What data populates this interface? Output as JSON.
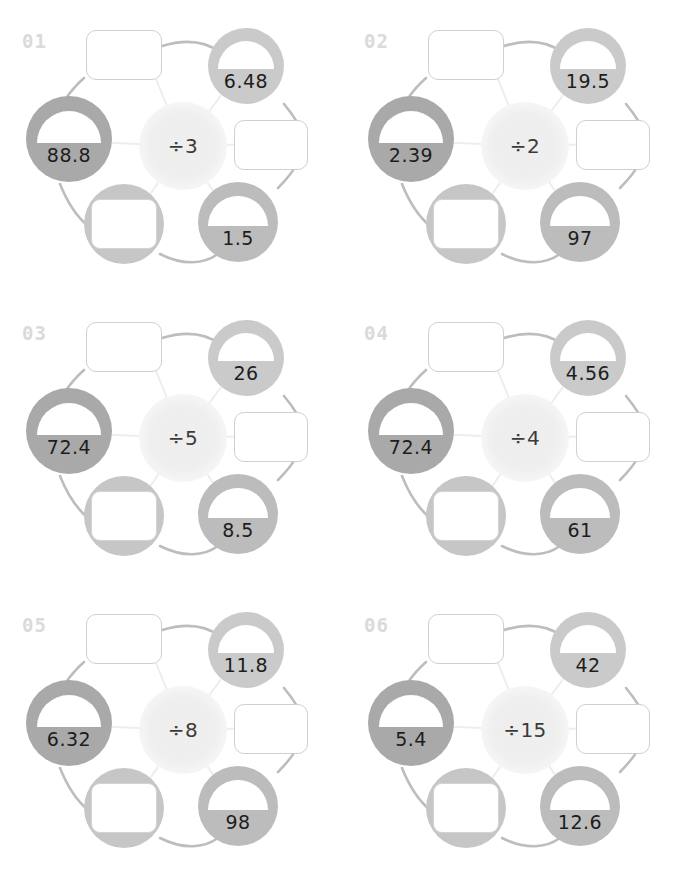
{
  "worksheet": {
    "title": "Division Wheels Worksheet",
    "node_layout": [
      "top-left-box",
      "top-right-circle",
      "left-circle",
      "right-box",
      "bottom-left-circle-box",
      "bottom-right-circle"
    ],
    "blank_slots": [
      "top-left-box",
      "right-box",
      "bottom-left-circle-box"
    ],
    "colors": {
      "page_background": "#ffffff",
      "index_label": "#d9dada",
      "hub_fill": "#efefef",
      "hub_text": "#3b3b3b",
      "node_light": "#c9cac9",
      "node_dark": "#a9a9a9",
      "node_mid": "#bcbcbc",
      "node_blank": "#c6c6c6",
      "dome_fill": "#ffffff",
      "value_text": "#1d1d1d",
      "box_border": "#cfcfcf",
      "link_stroke": "#bdbdbd",
      "spoke_stroke": "#eeeeee"
    },
    "puzzles": [
      {
        "index": "01",
        "operator": "÷3",
        "divisor": 3,
        "top_left_box": "",
        "top_right": "6.48",
        "left": "88.8",
        "right_box": "",
        "bottom_left_box": "",
        "bottom_right": "1.5"
      },
      {
        "index": "02",
        "operator": "÷2",
        "divisor": 2,
        "top_left_box": "",
        "top_right": "19.5",
        "left": "2.39",
        "right_box": "",
        "bottom_left_box": "",
        "bottom_right": "97"
      },
      {
        "index": "03",
        "operator": "÷5",
        "divisor": 5,
        "top_left_box": "",
        "top_right": "26",
        "left": "72.4",
        "right_box": "",
        "bottom_left_box": "",
        "bottom_right": "8.5"
      },
      {
        "index": "04",
        "operator": "÷4",
        "divisor": 4,
        "top_left_box": "",
        "top_right": "4.56",
        "left": "72.4",
        "right_box": "",
        "bottom_left_box": "",
        "bottom_right": "61"
      },
      {
        "index": "05",
        "operator": "÷8",
        "divisor": 8,
        "top_left_box": "",
        "top_right": "11.8",
        "left": "6.32",
        "right_box": "",
        "bottom_left_box": "",
        "bottom_right": "98"
      },
      {
        "index": "06",
        "operator": "÷15",
        "divisor": 15,
        "top_left_box": "",
        "top_right": "42",
        "left": "5.4",
        "right_box": "",
        "bottom_left_box": "",
        "bottom_right": "12.6"
      }
    ]
  }
}
